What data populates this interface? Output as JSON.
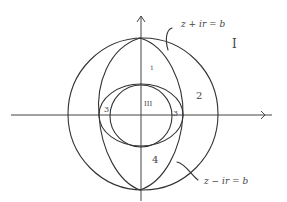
{
  "diagram": {
    "curve_labels": {
      "upper": "z + ir = b",
      "lower": "z − ir = b"
    },
    "region_labels": {
      "I": "I",
      "r1": "1",
      "r2": "2",
      "r3_left": "3",
      "r3_right": "3",
      "III": "III",
      "r4": "4"
    },
    "colors": {
      "stroke": "#333333",
      "background": "#ffffff"
    }
  }
}
